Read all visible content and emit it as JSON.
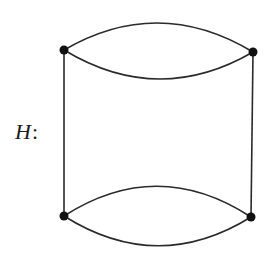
{
  "diagram": {
    "label": {
      "name": "H",
      "suffix": ":"
    },
    "stroke_color": "#2a2a2a",
    "vertex_color": "#111111",
    "vertices": [
      {
        "id": "v1",
        "x": 64,
        "y": 50
      },
      {
        "id": "v2",
        "x": 253,
        "y": 52
      },
      {
        "id": "v3",
        "x": 64,
        "y": 216
      },
      {
        "id": "v4",
        "x": 251,
        "y": 217
      }
    ],
    "edges": [
      {
        "from": "v1",
        "to": "v2",
        "type": "arc-up",
        "ctrl_y": -5
      },
      {
        "from": "v1",
        "to": "v2",
        "type": "arc-down",
        "ctrl_y": 107
      },
      {
        "from": "v3",
        "to": "v4",
        "type": "arc-up",
        "ctrl_y": 156
      },
      {
        "from": "v3",
        "to": "v4",
        "type": "arc-down",
        "ctrl_y": 275
      },
      {
        "from": "v1",
        "to": "v3",
        "type": "line"
      },
      {
        "from": "v2",
        "to": "v4",
        "type": "line"
      }
    ]
  }
}
